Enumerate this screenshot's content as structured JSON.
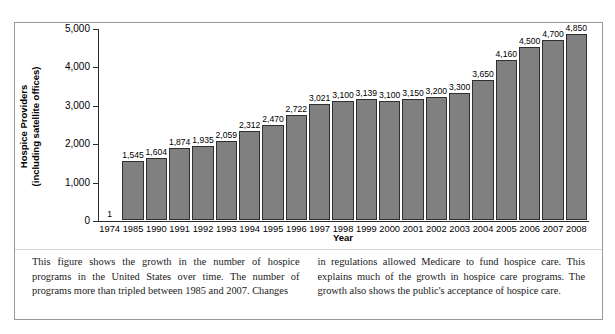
{
  "figure": {
    "x_axis_title": "Year",
    "y_axis_title_line1": "Hospice Providers",
    "y_axis_title_line2": "(including satellite offices)",
    "caption_left": "This figure shows the growth in the number of hospice programs in the United States over time. The number of programs more than tripled between 1985 and 2007. Changes",
    "caption_right": "in regulations allowed Medicare to fund hospice care. This explains much of the growth in hospice care programs. The growth also shows the public's acceptance of hospice care."
  },
  "chart_data": {
    "type": "bar",
    "title": "",
    "xlabel": "Year",
    "ylabel": "Hospice Providers (including satellite offices)",
    "ylim": [
      0,
      5000
    ],
    "ytick_values": [
      0,
      1000,
      2000,
      3000,
      4000,
      5000
    ],
    "ytick_labels": [
      "0",
      "1,000",
      "2,000",
      "3,000",
      "4,000",
      "5,000"
    ],
    "grid": false,
    "legend": null,
    "bar_color": "#808080",
    "bar_edge_color": "#2f2f2f",
    "categories": [
      "1974",
      "1985",
      "1990",
      "1991",
      "1992",
      "1993",
      "1994",
      "1995",
      "1996",
      "1997",
      "1998",
      "1999",
      "2000",
      "2001",
      "2002",
      "2003",
      "2004",
      "2005",
      "2006",
      "2007",
      "2008"
    ],
    "values": [
      1,
      1545,
      1604,
      1874,
      1935,
      2059,
      2312,
      2470,
      2722,
      3021,
      3100,
      3139,
      3100,
      3150,
      3200,
      3300,
      3650,
      4160,
      4500,
      4700,
      4850
    ],
    "value_labels": [
      "1",
      "1,545",
      "1,604",
      "1,874",
      "1,935",
      "2,059",
      "2,312",
      "2,470",
      "2,722",
      "3,021",
      "3,100",
      "3,139",
      "3,100",
      "3,150",
      "3,200",
      "3,300",
      "3,650",
      "4,160",
      "4,500",
      "4,700",
      "4,850"
    ]
  }
}
